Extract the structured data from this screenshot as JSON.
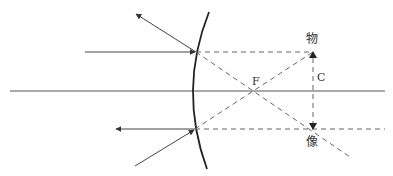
{
  "diagram": {
    "type": "convex-mirror-ray-diagram",
    "labels": {
      "object": "物",
      "image": "像",
      "focus": "F",
      "center": "C"
    },
    "colors": {
      "line": "#444444",
      "dashed": "#666666",
      "mirror": "#222222",
      "background": "#ffffff"
    }
  }
}
